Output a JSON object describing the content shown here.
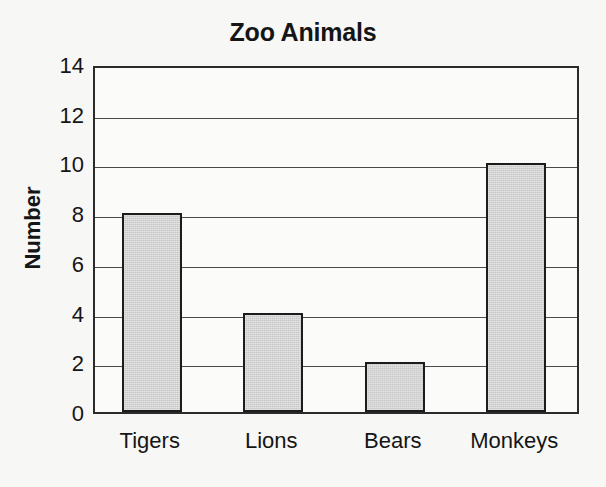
{
  "chart_data": {
    "type": "bar",
    "title": "Zoo Animals",
    "xlabel": "",
    "ylabel": "Number",
    "categories": [
      "Tigers",
      "Lions",
      "Bears",
      "Monkeys"
    ],
    "values": [
      8,
      4,
      2,
      10
    ],
    "ylim": [
      0,
      14
    ],
    "yticks": [
      0,
      2,
      4,
      6,
      8,
      10,
      12,
      14
    ],
    "ytick_labels": [
      "0",
      "2",
      "4",
      "6",
      "8",
      "10",
      "12",
      "14"
    ],
    "grid": "horizontal",
    "legend": "none",
    "bar_fill_color": "#c9c9c9",
    "bar_edge_color": "#1c1c1c",
    "background_color": "#f7f7f5",
    "axis_color": "#2b2b2b"
  }
}
